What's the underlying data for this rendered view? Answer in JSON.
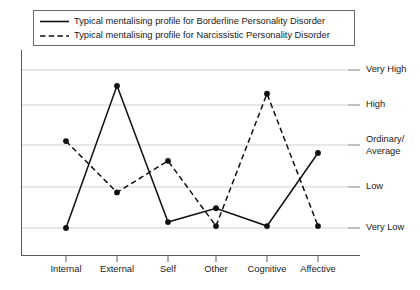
{
  "chart_data": {
    "type": "line",
    "title": "",
    "subtitle": "",
    "xlabel": "",
    "ylabel": "",
    "grid": true,
    "legend_position": "top",
    "categories": [
      "Internal",
      "External",
      "Self",
      "Other",
      "Cognitive",
      "Affective"
    ],
    "y_tick_labels": [
      "Very Low",
      "Low",
      "Ordinary/Average",
      "High",
      "Very High"
    ],
    "y_tick_labels_split": [
      [
        "Very Low"
      ],
      [
        "Low"
      ],
      [
        "Ordinary/",
        "Average"
      ],
      [
        "High"
      ],
      [
        "Very High"
      ]
    ],
    "y_tick_values": [
      1,
      2,
      3,
      4,
      5
    ],
    "ylim": [
      0.4,
      5.4
    ],
    "series": [
      {
        "name": "Typical mentalising profile for Borderline Personality Disorder",
        "style": "solid",
        "color": "#111111",
        "marker": "circle",
        "values": [
          1.0,
          4.6,
          1.15,
          1.5,
          1.05,
          2.9
        ]
      },
      {
        "name": "Typical mentalising profile for Narcissistic Personality Disorder",
        "style": "dashed",
        "color": "#111111",
        "marker": "circle",
        "values": [
          3.2,
          1.9,
          2.7,
          1.05,
          4.4,
          1.05
        ]
      }
    ]
  },
  "legend": {
    "entries": [
      {
        "label": "Typical mentalising profile for Borderline Personality Disorder",
        "style": "solid"
      },
      {
        "label": "Typical mentalising profile for Narcissistic Personality Disorder",
        "style": "dashed"
      }
    ]
  },
  "style": {
    "axis_color": "#5a5a5a",
    "grid_color": "#cfcfcf",
    "line_color": "#111111",
    "legend_border": "#6b6b6b",
    "background": "#ffffff"
  }
}
